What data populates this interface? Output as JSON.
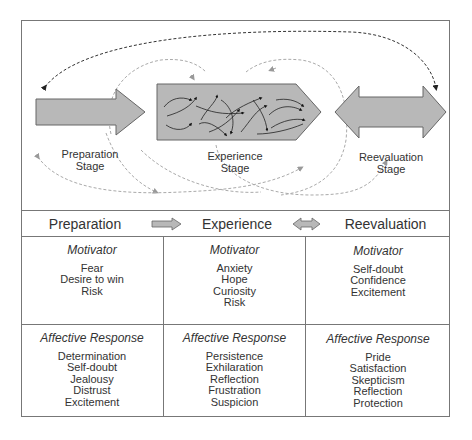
{
  "diagram": {
    "stages": [
      {
        "label_line1": "Preparation",
        "label_line2": "Stage"
      },
      {
        "label_line1": "Experience",
        "label_line2": "Stage"
      },
      {
        "label_line1": "Reevaluation",
        "label_line2": "Stage"
      }
    ],
    "colors": {
      "arrow_fill": "#b8b8b8",
      "arrow_stroke": "#666666",
      "dashed_dark": "#333333",
      "dashed_light": "#aaaaaa",
      "border": "#777777"
    }
  },
  "header": {
    "columns": [
      "Preparation",
      "Experience",
      "Reevaluation"
    ],
    "connector_1": "right-arrow-icon",
    "connector_2": "double-arrow-icon"
  },
  "table": {
    "motivator": [
      {
        "title": "Motivator",
        "items": [
          "Fear",
          "Desire to win",
          "Risk"
        ]
      },
      {
        "title": "Motivator",
        "items": [
          "Anxiety",
          "Hope",
          "Curiosity",
          "Risk"
        ]
      },
      {
        "title": "Motivator",
        "items": [
          "Self-doubt",
          "Confidence",
          "Excitement"
        ]
      }
    ],
    "affective": [
      {
        "title": "Affective Response",
        "items": [
          "Determination",
          "Self-doubt",
          "Jealousy",
          "Distrust",
          "Excitement"
        ]
      },
      {
        "title": "Affective Response",
        "items": [
          "Persistence",
          "Exhilaration",
          "Reflection",
          "Frustration",
          "Suspicion"
        ]
      },
      {
        "title": "Affective Response",
        "items": [
          "Pride",
          "Satisfaction",
          "Skepticism",
          "Reflection",
          "Protection"
        ]
      }
    ]
  }
}
